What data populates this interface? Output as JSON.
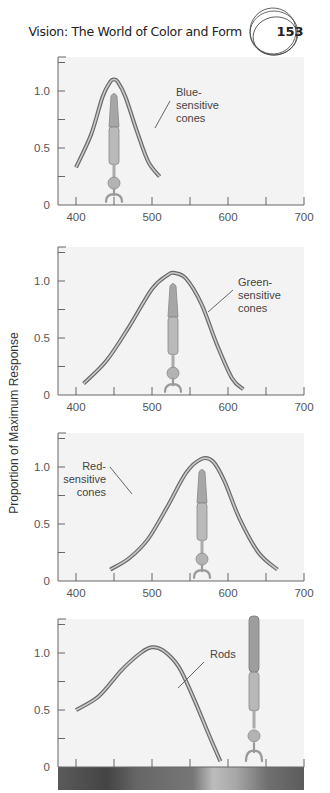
{
  "header": {
    "running_title": "Vision: The World of Color and Form",
    "page_number": "153"
  },
  "y_axis_label": "Proportion of Maximum Response",
  "colors": {
    "plot_bg": "#f3f3f3",
    "axis": "#666666",
    "curve_outer": "#6a6a6a",
    "curve_inner": "#c9c9c9",
    "cell": "#a9a9a9"
  },
  "chart_data": [
    {
      "type": "line",
      "title": "",
      "annotation": "Blue-sensitive cones",
      "annotation_lines": [
        "Blue-",
        "sensitive",
        "cones"
      ],
      "xlabel": "",
      "ylabel": "Proportion of Maximum Response",
      "xlim": [
        375,
        700
      ],
      "ylim": [
        0,
        1.25
      ],
      "xticks": [
        400,
        500,
        600,
        700
      ],
      "yticks": [
        0,
        0.5,
        1.0
      ],
      "grid": false,
      "series": [
        {
          "name": "Blue-sensitive cones",
          "x": [
            400,
            420,
            435,
            445,
            450,
            455,
            465,
            480,
            495,
            510
          ],
          "y": [
            0.33,
            0.62,
            0.95,
            1.08,
            1.1,
            1.08,
            0.95,
            0.65,
            0.38,
            0.25
          ]
        }
      ]
    },
    {
      "type": "line",
      "title": "",
      "annotation": "Green-sensitive cones",
      "annotation_lines": [
        "Green-",
        "sensitive",
        "cones"
      ],
      "xlim": [
        375,
        700
      ],
      "ylim": [
        0,
        1.25
      ],
      "xticks": [
        400,
        500,
        600,
        700
      ],
      "yticks": [
        0,
        0.5,
        1.0
      ],
      "grid": false,
      "series": [
        {
          "name": "Green-sensitive cones",
          "x": [
            410,
            440,
            470,
            500,
            520,
            530,
            545,
            565,
            585,
            605,
            620
          ],
          "y": [
            0.1,
            0.3,
            0.6,
            0.93,
            1.05,
            1.07,
            1.02,
            0.8,
            0.45,
            0.15,
            0.05
          ]
        }
      ]
    },
    {
      "type": "line",
      "title": "",
      "annotation": "Red-sensitive cones",
      "annotation_lines": [
        "Red-",
        "sensitive",
        "cones"
      ],
      "xlim": [
        375,
        700
      ],
      "ylim": [
        0,
        1.25
      ],
      "xticks": [
        400,
        500,
        600,
        700
      ],
      "yticks": [
        0,
        0.5,
        1.0
      ],
      "grid": false,
      "series": [
        {
          "name": "Red-sensitive cones",
          "x": [
            445,
            470,
            495,
            520,
            545,
            565,
            580,
            595,
            615,
            640,
            665
          ],
          "y": [
            0.1,
            0.2,
            0.37,
            0.65,
            0.95,
            1.07,
            1.05,
            0.88,
            0.55,
            0.25,
            0.1
          ]
        }
      ]
    },
    {
      "type": "line",
      "title": "",
      "annotation": "Rods",
      "annotation_lines": [
        "Rods"
      ],
      "xlim": [
        375,
        700
      ],
      "ylim": [
        0,
        1.25
      ],
      "xticks": [
        400,
        500,
        600,
        700
      ],
      "xtick_labels_hidden": true,
      "yticks": [
        0,
        0.5,
        1.0
      ],
      "grid": false,
      "spectrum_bar": true,
      "series": [
        {
          "name": "Rods",
          "x": [
            400,
            430,
            460,
            485,
            500,
            515,
            535,
            555,
            575,
            590
          ],
          "y": [
            0.5,
            0.62,
            0.85,
            1.0,
            1.05,
            1.02,
            0.88,
            0.6,
            0.28,
            0.05
          ]
        }
      ]
    }
  ]
}
